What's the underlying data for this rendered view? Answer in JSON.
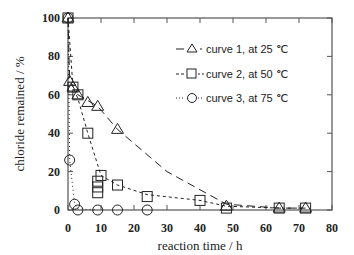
{
  "chart_data": {
    "type": "line",
    "title": "",
    "xlabel": "reaction time / h",
    "ylabel": "chloride remained / %",
    "xlim": [
      0,
      80
    ],
    "ylim": [
      0,
      100
    ],
    "xticks": [
      0,
      10,
      20,
      30,
      40,
      50,
      60,
      70,
      80
    ],
    "yticks": [
      0,
      20,
      40,
      60,
      80,
      100
    ],
    "grid": false,
    "legend_position": "upper right",
    "series": [
      {
        "name": "curve 1, at 25 ℃",
        "marker": "triangle",
        "line": "long-dash",
        "x": [
          0,
          0.5,
          1.5,
          3,
          6,
          9,
          15,
          48,
          64,
          72
        ],
        "y": [
          100,
          67,
          64,
          60,
          56,
          54,
          42,
          2,
          1,
          1
        ]
      },
      {
        "name": "curve 2, at 50 ℃",
        "marker": "square",
        "line": "short-dash",
        "x": [
          0,
          1.5,
          3,
          6,
          9,
          9,
          9,
          10,
          15,
          24,
          40,
          48,
          64,
          72
        ],
        "y": [
          100,
          64,
          60,
          40,
          15,
          12,
          9,
          18,
          13,
          7,
          5,
          1,
          1,
          1
        ]
      },
      {
        "name": "curve 3, at 75 ℃",
        "marker": "circle",
        "line": "dotted",
        "x": [
          0,
          0.5,
          2,
          3,
          9,
          15,
          24
        ],
        "y": [
          100,
          26,
          3,
          0,
          0,
          0,
          0
        ]
      }
    ]
  },
  "axes": {
    "xlabel": "reaction time / h",
    "ylabel": "chloride remained / %",
    "xtick_labels": [
      "0",
      "10",
      "20",
      "30",
      "40",
      "50",
      "60",
      "70",
      "80"
    ],
    "ytick_labels": [
      "0",
      "20",
      "40",
      "60",
      "80",
      "100"
    ]
  },
  "legend": {
    "items": [
      {
        "label": "curve 1, at 25 ℃"
      },
      {
        "label": "curve 2, at 50 ℃"
      },
      {
        "label": "curve 3, at 75 ℃"
      }
    ]
  },
  "colors": {
    "ink": "#222222",
    "frame": "#555555"
  }
}
